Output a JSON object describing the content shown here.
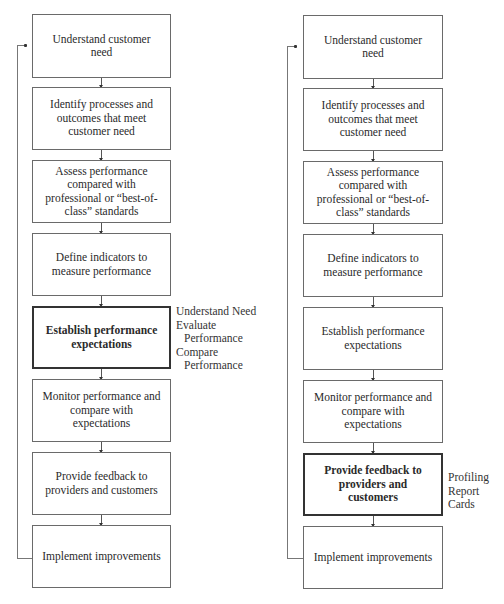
{
  "left_flow": {
    "steps": [
      {
        "label": "Understand customer need",
        "bold": false
      },
      {
        "label": "Identify processes and outcomes that meet customer need",
        "bold": false
      },
      {
        "label": "Assess performance compared with professional or “best-of-class” standards",
        "bold": false
      },
      {
        "label": "Define indicators to measure performance",
        "bold": false
      },
      {
        "label": "Establish performance expectations",
        "bold": true
      },
      {
        "label": "Monitor performance and compare with expectations",
        "bold": false
      },
      {
        "label": "Provide feedback to providers and customers",
        "bold": false
      },
      {
        "label": "Implement improvements",
        "bold": false
      }
    ],
    "annotation": {
      "line1": "Understand Need",
      "line2": "Evaluate",
      "line3": "Performance",
      "line4": "Compare",
      "line5": "Performance"
    }
  },
  "right_flow": {
    "steps": [
      {
        "label": "Understand customer need",
        "bold": false
      },
      {
        "label": "Identify processes and outcomes that meet customer need",
        "bold": false
      },
      {
        "label": "Assess performance compared with professional or “best-of-class” standards",
        "bold": false
      },
      {
        "label": "Define indicators to measure performance",
        "bold": false
      },
      {
        "label": "Establish performance expectations",
        "bold": false
      },
      {
        "label": "Monitor performance and compare with expectations",
        "bold": false
      },
      {
        "label": "Provide feedback to providers and customers",
        "bold": true
      },
      {
        "label": "Implement improvements",
        "bold": false
      }
    ],
    "annotation": {
      "line1": "Profiling",
      "line2": "Report Cards"
    }
  }
}
